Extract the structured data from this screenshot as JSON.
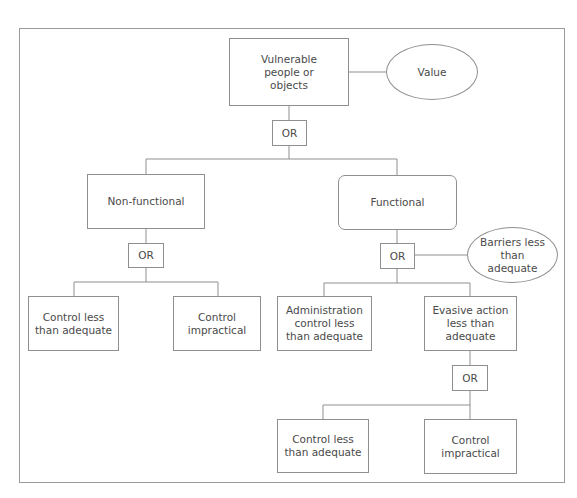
{
  "diagram": {
    "type": "fault-tree",
    "colors": {
      "line": "#8f8f8f",
      "text": "#4a4a4a",
      "background": "#ffffff"
    },
    "nodes": {
      "root": {
        "label": "Vulnerable people or objects",
        "shape": "rectangle"
      },
      "value": {
        "label": "Value",
        "shape": "ellipse"
      },
      "gate_root": {
        "label": "OR",
        "shape": "gate"
      },
      "non_functional": {
        "label": "Non-functional",
        "shape": "rectangle"
      },
      "functional": {
        "label": "Functional",
        "shape": "rounded-rectangle"
      },
      "gate_nonfunc": {
        "label": "OR",
        "shape": "gate"
      },
      "gate_func": {
        "label": "OR",
        "shape": "gate"
      },
      "barriers": {
        "label": "Barriers less than adequate",
        "shape": "ellipse"
      },
      "nf_control_lta": {
        "label": "Control less than adequate",
        "shape": "rectangle"
      },
      "nf_control_impractical": {
        "label": "Control impractical",
        "shape": "rectangle"
      },
      "admin_control": {
        "label": "Administration control less than adequate",
        "shape": "rectangle"
      },
      "evasive_action": {
        "label": "Evasive action less than adequate",
        "shape": "rectangle"
      },
      "gate_evasive": {
        "label": "OR",
        "shape": "gate"
      },
      "ev_control_lta": {
        "label": "Control less than adequate",
        "shape": "rectangle"
      },
      "ev_control_impractical": {
        "label": "Control impractical",
        "shape": "rectangle"
      }
    },
    "edges": [
      [
        "root",
        "value"
      ],
      [
        "root",
        "gate_root"
      ],
      [
        "gate_root",
        "non_functional"
      ],
      [
        "gate_root",
        "functional"
      ],
      [
        "non_functional",
        "gate_nonfunc"
      ],
      [
        "gate_nonfunc",
        "nf_control_lta"
      ],
      [
        "gate_nonfunc",
        "nf_control_impractical"
      ],
      [
        "functional",
        "gate_func"
      ],
      [
        "gate_func",
        "barriers"
      ],
      [
        "gate_func",
        "admin_control"
      ],
      [
        "gate_func",
        "evasive_action"
      ],
      [
        "evasive_action",
        "gate_evasive"
      ],
      [
        "gate_evasive",
        "ev_control_lta"
      ],
      [
        "gate_evasive",
        "ev_control_impractical"
      ]
    ]
  }
}
